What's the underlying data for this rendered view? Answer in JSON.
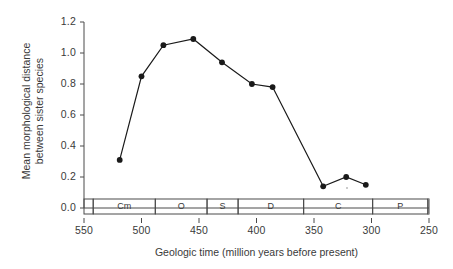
{
  "chart_data": {
    "type": "line",
    "title": "",
    "xlabel": "Geologic time (million years before present)",
    "ylabel": "Mean morphological distance between sister species",
    "ylabel_line1": "Mean morphological distance",
    "ylabel_line2": "between sister species",
    "xlim": [
      550,
      250
    ],
    "ylim": [
      0.0,
      1.2
    ],
    "x_inverted": true,
    "grid": false,
    "legend": null,
    "xticks": [
      550,
      500,
      450,
      400,
      350,
      300,
      250
    ],
    "xtick_labels": [
      "550",
      "500",
      "450",
      "400",
      "350",
      "300",
      "250"
    ],
    "yticks": [
      0.0,
      0.2,
      0.4,
      0.6,
      0.8,
      1.0,
      1.2
    ],
    "ytick_labels": [
      "0.0",
      "0.2",
      "0.4",
      "0.6",
      "0.8",
      "1.0",
      "1.2"
    ],
    "x": [
      519,
      500,
      481,
      455,
      430,
      404,
      386,
      342,
      322,
      305
    ],
    "values": [
      0.31,
      0.85,
      1.05,
      1.09,
      0.94,
      0.8,
      0.78,
      0.14,
      0.2,
      0.15
    ],
    "marker": "filled-circle",
    "line_color": "#1a1a1a",
    "marker_color": "#1a1a1a",
    "period_bar": {
      "label": "Geologic periods",
      "periods": [
        {
          "abbr": "Cm",
          "start": 542,
          "end": 488
        },
        {
          "abbr": "O",
          "start": 488,
          "end": 443
        },
        {
          "abbr": "S",
          "start": 443,
          "end": 416
        },
        {
          "abbr": "D",
          "start": 416,
          "end": 359
        },
        {
          "abbr": "C",
          "start": 359,
          "end": 299
        },
        {
          "abbr": "P",
          "start": 299,
          "end": 251
        }
      ]
    }
  }
}
